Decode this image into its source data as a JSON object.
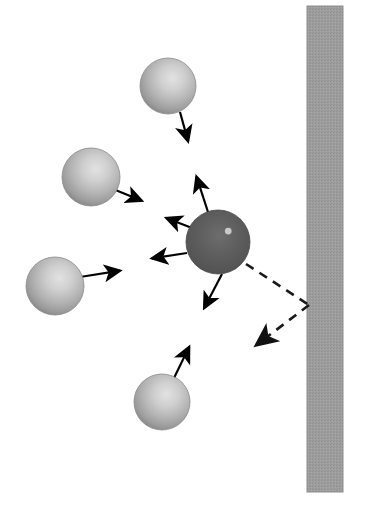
{
  "figure": {
    "title": "Schematic of particle interaction forces near a wall",
    "background_color": "#ffffff",
    "width": 366,
    "height": 506
  },
  "wall": {
    "label": "wall",
    "color": "#9a9a9a",
    "edge_color": "#8d8d8d",
    "x": 307,
    "y": 6,
    "width": 36,
    "height": 486
  },
  "central_particle": {
    "label": "central-particle",
    "color": "#5c5c5c",
    "highlight_color": "#c8c8c8",
    "cx": 218,
    "cy": 242,
    "r": 32
  },
  "neighbor_particles": [
    {
      "label": "neighbor-particle-top",
      "color": "#b0b0b0",
      "cx": 168,
      "cy": 86,
      "r": 28
    },
    {
      "label": "neighbor-particle-upper-left",
      "color": "#b0b0b0",
      "cx": 91,
      "cy": 177,
      "r": 29
    },
    {
      "label": "neighbor-particle-lower-left",
      "color": "#b0b0b0",
      "cx": 55,
      "cy": 286,
      "r": 29
    },
    {
      "label": "neighbor-particle-bottom",
      "color": "#b0b0b0",
      "cx": 162,
      "cy": 402,
      "r": 28
    }
  ],
  "force_arrows": [
    {
      "label": "arrow-from-top-neighbor",
      "style": "solid",
      "color": "#000000",
      "x1": 180,
      "y1": 112,
      "x2": 191,
      "y2": 152
    },
    {
      "label": "arrow-to-top-neighbor",
      "style": "solid",
      "color": "#000000",
      "x1": 208,
      "y1": 212,
      "x2": 193,
      "y2": 166
    },
    {
      "label": "arrow-from-upper-left-neighbor",
      "style": "solid",
      "color": "#000000",
      "x1": 113,
      "y1": 189,
      "x2": 152,
      "y2": 205
    },
    {
      "label": "arrow-to-upper-left-neighbor",
      "style": "solid",
      "color": "#000000",
      "x1": 192,
      "y1": 228,
      "x2": 156,
      "y2": 214
    },
    {
      "label": "arrow-from-lower-left-neighbor",
      "style": "solid",
      "color": "#000000",
      "x1": 80,
      "y1": 277,
      "x2": 131,
      "y2": 269
    },
    {
      "label": "arrow-to-lower-left-neighbor",
      "style": "solid",
      "color": "#000000",
      "x1": 187,
      "y1": 253,
      "x2": 141,
      "y2": 260
    },
    {
      "label": "arrow-from-bottom-neighbor",
      "style": "solid",
      "color": "#000000",
      "x1": 174,
      "y1": 378,
      "x2": 194,
      "y2": 337
    },
    {
      "label": "arrow-to-bottom-neighbor",
      "style": "solid",
      "color": "#000000",
      "x1": 222,
      "y1": 274,
      "x2": 199,
      "y2": 318
    }
  ],
  "wall_interaction": {
    "incident_line": {
      "label": "dashed-incident-line",
      "style": "dashed",
      "color": "#1a1a1a",
      "x1": 246,
      "y1": 264,
      "x2": 309,
      "y2": 305
    },
    "reflected_arrow": {
      "label": "dashed-reflected-arrow",
      "style": "dashed",
      "color": "#1a1a1a",
      "x1": 309,
      "y1": 305,
      "x2": 246,
      "y2": 353
    },
    "dash_pattern": "9 7"
  }
}
